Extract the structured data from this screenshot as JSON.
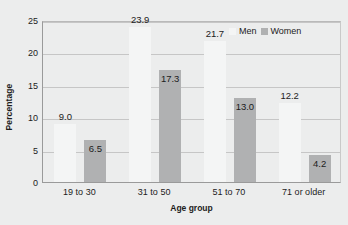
{
  "chart_data": {
    "type": "bar",
    "title": "",
    "subtitle": "",
    "xlabel": "Age group",
    "ylabel": "Percentage",
    "categories": [
      "19 to 30",
      "31 to 50",
      "51 to 70",
      "71 or older"
    ],
    "series": [
      {
        "name": "Men",
        "values": [
          9.0,
          23.9,
          21.7,
          12.2
        ],
        "labels": [
          "9.0",
          "23.9",
          "21.7",
          "12.2"
        ],
        "color": "#f4f5f5"
      },
      {
        "name": "Women",
        "values": [
          6.5,
          17.3,
          13.0,
          4.2
        ],
        "labels": [
          "6.5",
          "17.3",
          "13.0",
          "4.2"
        ],
        "color": "#b0b1b2"
      }
    ],
    "ylim": [
      0,
      25
    ],
    "yticks": [
      0,
      5,
      10,
      15,
      20,
      25
    ],
    "ytick_labels": [
      "0",
      "5",
      "10",
      "15",
      "20",
      "25"
    ],
    "grid": "horizontal",
    "legend_position": "top-right",
    "legend_entries": [
      "Men",
      "Women"
    ],
    "background_color": "#eceded",
    "axis_color": "#9a9a9a",
    "grid_color": "#c6c6c6",
    "text_color": "#1c1c1c"
  }
}
